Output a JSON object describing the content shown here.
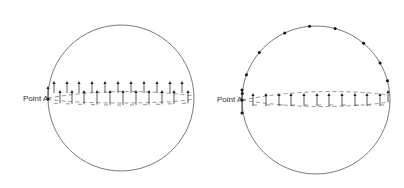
{
  "figures": [
    {
      "id": "left",
      "label": "Point A",
      "circle": {
        "cx": 121,
        "cy": 98,
        "r": 73
      },
      "point_a": {
        "x": 48,
        "y": 99
      },
      "label_pos": {
        "x": 23,
        "y": 101
      },
      "description": "Arrows all pointing up along the equatorial band"
    },
    {
      "id": "right",
      "label": "Point A",
      "circle": {
        "cx": 316,
        "cy": 100,
        "r": 74
      },
      "point_a": {
        "x": 242,
        "y": 100
      },
      "label_pos": {
        "x": 217,
        "y": 102
      },
      "description": "Arrows pointing up along the band; dots along upper circumference"
    }
  ],
  "colors": {
    "stroke": "#6a6a6a",
    "arrow": "#333333"
  }
}
